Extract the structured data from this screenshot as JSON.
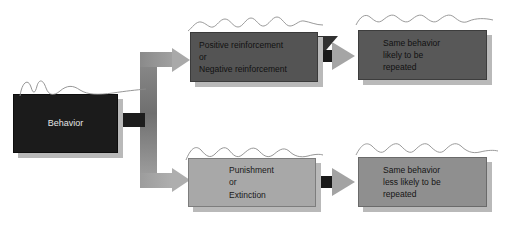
{
  "diagram": {
    "background_color": "#ffffff",
    "nodes": {
      "behavior": {
        "label": "Behavior",
        "fill": "#1b1b1b",
        "text_color": "#e4e4e4"
      },
      "reinforcement": {
        "label": "Positive reinforcement\nor\nNegative reinforcement",
        "fill": "#545454",
        "text_color": "#111111"
      },
      "likely": {
        "label": "Same behavior\nlikely to be\nrepeated",
        "fill": "#585858",
        "text_color": "#111111"
      },
      "punishment": {
        "label": "Punishment\nor\nExtinction",
        "fill": "#a8a8a8",
        "text_color": "#1a1a1a"
      },
      "less_likely": {
        "label": "Same behavior\nless likely to be\nrepeated",
        "fill": "#8f8f8f",
        "text_color": "#151515"
      }
    },
    "connectors": {
      "behavior_to_branch": "behavior-trunk-connector",
      "branch_up": "arrow-to-reinforcement",
      "branch_down": "arrow-to-punishment",
      "reinforcement_to_likely": "arrow-reinforcement-to-likely",
      "punishment_to_less_likely": "arrow-punishment-to-less-likely"
    },
    "decorations": {
      "squiggle_count": 5,
      "squiggle_color": "#8a8a8a"
    }
  }
}
